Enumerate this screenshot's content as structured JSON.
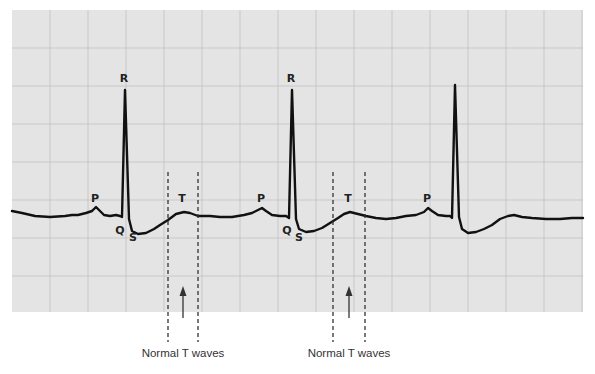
{
  "figure": {
    "paper_color": "#e4e4e4",
    "grid_color": "#bdbdbd",
    "trace_color": "#111111",
    "paper": {
      "x": 12,
      "y": 10,
      "width": 571,
      "height": 302
    },
    "grid_spacing": 38
  },
  "complexes": [
    {
      "labels": [
        {
          "text": "P",
          "x": 95,
          "y": 202
        },
        {
          "text": "R",
          "x": 124,
          "y": 82
        },
        {
          "text": "Q",
          "x": 120,
          "y": 234
        },
        {
          "text": "S",
          "x": 133,
          "y": 241
        },
        {
          "text": "T",
          "x": 182,
          "y": 202
        }
      ],
      "t_wave_markers": {
        "left_x": 168,
        "right_x": 198,
        "arrow_x": 183
      }
    },
    {
      "labels": [
        {
          "text": "P",
          "x": 261,
          "y": 202
        },
        {
          "text": "R",
          "x": 291,
          "y": 82
        },
        {
          "text": "Q",
          "x": 287,
          "y": 234
        },
        {
          "text": "S",
          "x": 299,
          "y": 241
        },
        {
          "text": "T",
          "x": 348,
          "y": 202
        }
      ],
      "t_wave_markers": {
        "left_x": 333,
        "right_x": 365,
        "arrow_x": 349
      }
    },
    {
      "labels": [
        {
          "text": "P",
          "x": 427,
          "y": 202
        }
      ]
    }
  ],
  "captions": [
    {
      "text": "Normal T waves",
      "x": 183,
      "y": 357
    },
    {
      "text": "Normal T waves",
      "x": 349,
      "y": 357
    }
  ],
  "trace_points": [
    [
      12,
      211
    ],
    [
      22,
      213
    ],
    [
      35,
      216
    ],
    [
      50,
      217
    ],
    [
      65,
      216
    ],
    [
      72,
      215
    ],
    [
      78,
      215
    ],
    [
      86,
      213
    ],
    [
      92,
      211
    ],
    [
      96,
      207
    ],
    [
      100,
      211
    ],
    [
      104,
      215
    ],
    [
      110,
      216
    ],
    [
      116,
      215
    ],
    [
      120,
      216
    ],
    [
      122,
      217
    ],
    [
      125,
      90
    ],
    [
      129,
      219
    ],
    [
      132,
      231
    ],
    [
      138,
      234
    ],
    [
      146,
      233
    ],
    [
      154,
      229
    ],
    [
      160,
      225
    ],
    [
      168,
      220
    ],
    [
      176,
      214
    ],
    [
      184,
      212
    ],
    [
      190,
      213
    ],
    [
      198,
      216
    ],
    [
      210,
      216
    ],
    [
      220,
      217
    ],
    [
      232,
      217
    ],
    [
      244,
      215
    ],
    [
      252,
      213
    ],
    [
      258,
      210
    ],
    [
      262,
      208
    ],
    [
      266,
      211
    ],
    [
      272,
      215
    ],
    [
      280,
      216
    ],
    [
      286,
      216
    ],
    [
      289,
      218
    ],
    [
      292,
      90
    ],
    [
      296,
      219
    ],
    [
      299,
      229
    ],
    [
      306,
      232
    ],
    [
      314,
      231
    ],
    [
      322,
      228
    ],
    [
      330,
      223
    ],
    [
      338,
      218
    ],
    [
      344,
      214
    ],
    [
      350,
      212
    ],
    [
      358,
      214
    ],
    [
      366,
      216
    ],
    [
      376,
      218
    ],
    [
      386,
      219
    ],
    [
      396,
      218
    ],
    [
      406,
      216
    ],
    [
      416,
      215
    ],
    [
      424,
      212
    ],
    [
      428,
      208
    ],
    [
      432,
      211
    ],
    [
      438,
      215
    ],
    [
      446,
      216
    ],
    [
      450,
      216
    ],
    [
      452,
      218
    ],
    [
      455,
      85
    ],
    [
      459,
      217
    ],
    [
      462,
      229
    ],
    [
      468,
      233
    ],
    [
      476,
      232
    ],
    [
      484,
      229
    ],
    [
      492,
      225
    ],
    [
      500,
      219
    ],
    [
      508,
      216
    ],
    [
      514,
      215
    ],
    [
      522,
      217
    ],
    [
      532,
      218
    ],
    [
      546,
      219
    ],
    [
      560,
      219
    ],
    [
      572,
      218
    ],
    [
      583,
      218
    ]
  ]
}
